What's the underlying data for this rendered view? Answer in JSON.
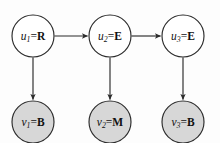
{
  "figure": {
    "title": "",
    "type": "directed-graph",
    "background_color": "#fdfdfd",
    "stroke_color": "#2b2b2b",
    "hidden_node_fill": "#ffffff",
    "observed_node_fill": "#d7d7d7"
  },
  "nodes": {
    "hidden": [
      {
        "id": "u1",
        "var": "u",
        "sub": "1",
        "eq": "=",
        "value": "R",
        "cx": 33,
        "cy": 36,
        "r": 21
      },
      {
        "id": "u2",
        "var": "u",
        "sub": "2",
        "eq": "=",
        "value": "E",
        "cx": 110,
        "cy": 36,
        "r": 21
      },
      {
        "id": "u3",
        "var": "u",
        "sub": "3",
        "eq": "=",
        "value": "E",
        "cx": 183,
        "cy": 36,
        "r": 21
      }
    ],
    "observed": [
      {
        "id": "v1",
        "var": "v",
        "sub": "1",
        "eq": "=",
        "value": "B",
        "cx": 33,
        "cy": 122,
        "r": 21
      },
      {
        "id": "v2",
        "var": "v",
        "sub": "2",
        "eq": "=",
        "value": "M",
        "cx": 110,
        "cy": 122,
        "r": 21
      },
      {
        "id": "v3",
        "var": "v",
        "sub": "3",
        "eq": "=",
        "value": "B",
        "cx": 183,
        "cy": 122,
        "r": 21
      }
    ]
  },
  "edges": [
    {
      "id": "u1-u2",
      "from": "u1",
      "to": "u2",
      "direction": "horizontal"
    },
    {
      "id": "u2-u3",
      "from": "u2",
      "to": "u3",
      "direction": "horizontal"
    },
    {
      "id": "u1-v1",
      "from": "u1",
      "to": "v1",
      "direction": "vertical"
    },
    {
      "id": "u2-v2",
      "from": "u2",
      "to": "v2",
      "direction": "vertical"
    },
    {
      "id": "u3-v3",
      "from": "u3",
      "to": "v3",
      "direction": "vertical"
    }
  ]
}
